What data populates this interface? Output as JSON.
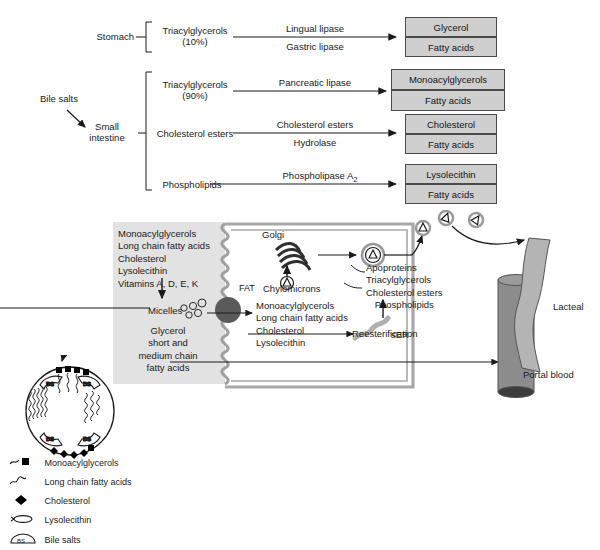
{
  "figure": {
    "type": "biological-pathway-diagram"
  },
  "digestion": {
    "bile_salts_label": "Bile salts",
    "sites": [
      {
        "name": "Stomach",
        "line1": "Stomach",
        "line2": ""
      },
      {
        "name": "Small intestine",
        "line1": "Small",
        "line2": "intestine"
      }
    ],
    "rows": [
      {
        "substrate_line1": "Triacylglycerols",
        "substrate_line2": "(10%)",
        "enzyme_line1": "Lingual lipase",
        "enzyme_line2": "Gastric lipase",
        "products": [
          "Glycerol",
          "Fatty acids"
        ]
      },
      {
        "substrate_line1": "Triacylglycerols",
        "substrate_line2": "(90%)",
        "enzyme_line1": "Pancreatic lipase",
        "enzyme_line2": "",
        "products": [
          "Monoacylglycerols",
          "Fatty acids"
        ]
      },
      {
        "substrate_line1": "Cholesterol esters",
        "substrate_line2": "",
        "enzyme_line1": "Cholesterol esters",
        "enzyme_line2": "Hydrolase",
        "products": [
          "Cholesterol",
          "Fatty acids"
        ]
      },
      {
        "substrate_line1": "Phospholipids",
        "substrate_line2": "",
        "enzyme_line1": "Phospholipase A",
        "enzyme_sub": "2",
        "enzyme_line2": "",
        "products": [
          "Lysolecithin",
          "Fatty acids"
        ]
      }
    ]
  },
  "enterocyte": {
    "lumen_list": [
      "Monoacylglycerols",
      "Long chain fatty acids",
      "Cholesterol",
      "Lysolecithin",
      "Vitamins A, D, E, K"
    ],
    "micelles_label": "Micelles",
    "lumen_small_lipids": [
      "Glycerol",
      "short and",
      "medium chain",
      "fatty acids"
    ],
    "fat_label": "FAT",
    "cell_list": [
      "Monoacylglycerols",
      "Long chain fatty acids",
      "Cholesterol",
      "Lysolecithin"
    ],
    "reesterification_label": "Reesterification",
    "ser_label": "sER",
    "golgi_label": "Golgi",
    "chylomicrons_label": "Chylomicrons",
    "chylomicron_components": [
      "Apoproteins",
      "Triacylglycerols",
      "Cholesterol esters",
      "Phospholipids"
    ],
    "lacteal_label": "Lacteal",
    "portal_blood_label": "Portal blood"
  },
  "legend": {
    "items": [
      {
        "symbol": "squiggle-square",
        "label": "Monoacylglycerols"
      },
      {
        "symbol": "squiggle",
        "label": "Long chain fatty acids"
      },
      {
        "symbol": "diamond",
        "label": "Cholesterol"
      },
      {
        "symbol": "lens",
        "label": "Lysolecithin"
      },
      {
        "symbol": "bile-salt",
        "label": "Bile salts"
      }
    ],
    "bile_salt_abbrev": "BS"
  },
  "colors": {
    "box_fill": "#cfcfcf",
    "box_stroke": "#4a4a4a",
    "lumen_fill": "#e2e2e2",
    "membrane": "#9a9a9a",
    "fat_droplet": "#5a5a5a",
    "vessel_fill": "#8c8c8c",
    "lacteal_fill": "#b4b4b4",
    "text": "#1a1a1a"
  }
}
